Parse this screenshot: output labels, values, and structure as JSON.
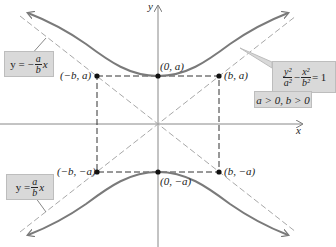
{
  "diagram": {
    "axes": {
      "x_label": "x",
      "y_label": "y"
    },
    "points": [
      {
        "label": "(0, a)",
        "x": "0",
        "y": "a"
      },
      {
        "label": "(0, −a)",
        "x": "0",
        "y": "−a"
      },
      {
        "label": "(−b, a)",
        "x": "−b",
        "y": "a"
      },
      {
        "label": "(b, a)",
        "x": "b",
        "y": "a"
      },
      {
        "label": "(−b, −a)",
        "x": "−b",
        "y": "−a"
      },
      {
        "label": "(b, −a)",
        "x": "b",
        "y": "−a"
      }
    ],
    "equation": {
      "lhs_term1_num": "y²",
      "lhs_term1_den": "a²",
      "minus": "−",
      "lhs_term2_num": "x²",
      "lhs_term2_den": "b²",
      "rhs": "= 1",
      "condition": "a > 0, b > 0"
    },
    "asymptote_negative": {
      "prefix": "y = −",
      "num": "a",
      "den": "b",
      "suffix": "x"
    },
    "asymptote_positive": {
      "prefix": "y =",
      "num": "a",
      "den": "b",
      "suffix": "x"
    },
    "colors": {
      "curve": "#7a7a7a",
      "asymptote": "#a8a8a8",
      "box": "#333333",
      "axis": "#888888",
      "callout_bg": "#d9d9d9"
    }
  }
}
